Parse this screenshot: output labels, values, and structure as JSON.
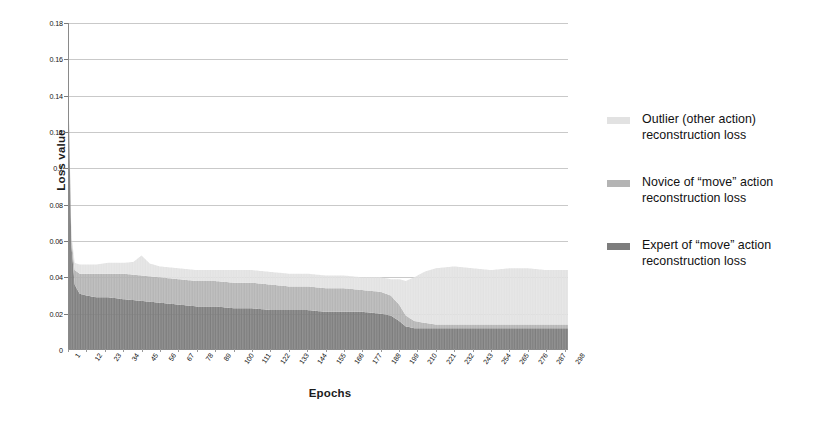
{
  "chart_data": {
    "type": "area",
    "stacked": true,
    "title": "",
    "xlabel": "Epochs",
    "ylabel": "Loss value",
    "ylim": [
      0,
      0.18
    ],
    "yticks": [
      "0",
      "0.02",
      "0.04",
      "0.06",
      "0.08",
      "0.1",
      "0.12",
      "0.14",
      "0.16",
      "0.18"
    ],
    "ytick_values": [
      0,
      0.02,
      0.04,
      0.06,
      0.08,
      0.1,
      0.12,
      0.14,
      0.16,
      0.18
    ],
    "grid": true,
    "legend_position": "right",
    "x_start": 1,
    "x_end": 300,
    "xtick_labels": [
      "1",
      "12",
      "23",
      "34",
      "45",
      "56",
      "67",
      "78",
      "89",
      "100",
      "111",
      "122",
      "133",
      "144",
      "155",
      "166",
      "177",
      "188",
      "199",
      "210",
      "221",
      "232",
      "243",
      "254",
      "265",
      "276",
      "287",
      "298"
    ],
    "xtick_values": [
      1,
      12,
      23,
      34,
      45,
      56,
      67,
      78,
      89,
      100,
      111,
      122,
      133,
      144,
      155,
      166,
      177,
      188,
      199,
      210,
      221,
      232,
      243,
      254,
      265,
      276,
      287,
      298
    ],
    "colors": {
      "outlier": "#e2e2e2",
      "novice": "#b4b4b4",
      "expert": "#7d7d7d"
    },
    "series": [
      {
        "name": "Expert of \"move\" action reconstruction loss",
        "key": "expert",
        "color": "#7d7d7d",
        "x": [
          1,
          3,
          5,
          8,
          12,
          18,
          25,
          34,
          45,
          56,
          67,
          78,
          89,
          100,
          111,
          122,
          133,
          144,
          155,
          166,
          177,
          188,
          194,
          199,
          203,
          208,
          214,
          221,
          232,
          243,
          254,
          265,
          276,
          287,
          298,
          300
        ],
        "values": [
          0.155,
          0.058,
          0.036,
          0.031,
          0.03,
          0.029,
          0.029,
          0.028,
          0.027,
          0.026,
          0.025,
          0.024,
          0.024,
          0.023,
          0.023,
          0.022,
          0.022,
          0.022,
          0.021,
          0.021,
          0.021,
          0.02,
          0.019,
          0.016,
          0.013,
          0.012,
          0.012,
          0.012,
          0.012,
          0.012,
          0.012,
          0.012,
          0.012,
          0.012,
          0.012,
          0.012
        ]
      },
      {
        "name": "Novice of \"move\" action reconstruction loss",
        "key": "novice",
        "color": "#b4b4b4",
        "x": [
          1,
          3,
          5,
          8,
          12,
          18,
          25,
          34,
          45,
          56,
          67,
          78,
          89,
          100,
          111,
          122,
          133,
          144,
          155,
          166,
          177,
          188,
          194,
          199,
          203,
          208,
          214,
          221,
          232,
          243,
          254,
          265,
          276,
          287,
          298,
          300
        ],
        "values": [
          0.0,
          0.004,
          0.008,
          0.011,
          0.012,
          0.013,
          0.013,
          0.014,
          0.014,
          0.014,
          0.014,
          0.014,
          0.014,
          0.014,
          0.014,
          0.014,
          0.013,
          0.013,
          0.013,
          0.013,
          0.012,
          0.012,
          0.011,
          0.009,
          0.006,
          0.004,
          0.003,
          0.002,
          0.002,
          0.002,
          0.002,
          0.002,
          0.002,
          0.002,
          0.002,
          0.002
        ]
      },
      {
        "name": "Outlier (other action) reconstruction loss",
        "key": "outlier",
        "color": "#e2e2e2",
        "x": [
          1,
          3,
          5,
          8,
          12,
          18,
          25,
          34,
          40,
          45,
          50,
          56,
          62,
          67,
          78,
          89,
          100,
          111,
          122,
          133,
          144,
          155,
          166,
          177,
          188,
          194,
          199,
          203,
          208,
          214,
          221,
          232,
          243,
          254,
          265,
          276,
          287,
          298,
          300
        ],
        "values": [
          0.0,
          0.002,
          0.004,
          0.005,
          0.005,
          0.005,
          0.006,
          0.006,
          0.007,
          0.011,
          0.007,
          0.006,
          0.006,
          0.006,
          0.006,
          0.006,
          0.007,
          0.007,
          0.007,
          0.007,
          0.007,
          0.007,
          0.007,
          0.007,
          0.008,
          0.009,
          0.014,
          0.019,
          0.024,
          0.028,
          0.031,
          0.032,
          0.031,
          0.03,
          0.031,
          0.031,
          0.03,
          0.03,
          0.03
        ]
      }
    ],
    "stack_totals_note": "Stacked totals remain near 0.045-0.047 after initial spike"
  },
  "legend": {
    "items": [
      {
        "swatch_color": "#e2e2e2",
        "line1": "Outlier (other action)",
        "line2": "reconstruction loss"
      },
      {
        "swatch_color": "#b4b4b4",
        "line1": "Novice of “move” action",
        "line2": "reconstruction loss"
      },
      {
        "swatch_color": "#7d7d7d",
        "line1": "Expert of “move” action",
        "line2": "reconstruction loss"
      }
    ]
  }
}
